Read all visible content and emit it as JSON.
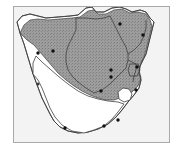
{
  "figure": {
    "kind": "distribution-map",
    "region": "Southern Africa",
    "frame": {
      "x": 13,
      "y": 6,
      "width": 157,
      "height": 137,
      "border_color": "#a9a9a9"
    },
    "colors": {
      "background": "#ffffff",
      "sea": "#f3f3f3",
      "land_unshaded": "#ffffff",
      "range_shading": "#9d9d9d",
      "stipple": "#7a7a7a",
      "coastline": "#404040",
      "country_border": "#404040",
      "point_marker": "#101010",
      "frame_border": "#a9a9a9"
    },
    "legend": {
      "shaded_area_label": "shaded distribution range",
      "point_label": "locality record"
    },
    "countries": [
      {
        "name": "Namibia",
        "shaded": true
      },
      {
        "name": "Botswana",
        "shaded": true
      },
      {
        "name": "Zimbabwe",
        "shaded": true
      },
      {
        "name": "Mozambique",
        "shaded": true
      },
      {
        "name": "South Africa",
        "shaded": "partial"
      },
      {
        "name": "Lesotho",
        "shaded": false
      },
      {
        "name": "Eswatini",
        "shaded": true
      }
    ],
    "points": [
      {
        "id": "p1",
        "x": 38,
        "y": 53
      },
      {
        "id": "p2",
        "x": 53,
        "y": 51
      },
      {
        "id": "p3",
        "x": 120,
        "y": 24
      },
      {
        "id": "p4",
        "x": 143,
        "y": 35
      },
      {
        "id": "p5",
        "x": 111,
        "y": 70
      },
      {
        "id": "p6",
        "x": 111,
        "y": 77
      },
      {
        "id": "p7",
        "x": 137,
        "y": 67
      },
      {
        "id": "p8",
        "x": 136,
        "y": 90
      },
      {
        "id": "p9",
        "x": 101,
        "y": 91
      },
      {
        "id": "p10",
        "x": 38,
        "y": 84
      },
      {
        "id": "p11",
        "x": 65,
        "y": 128
      },
      {
        "id": "p12",
        "x": 104,
        "y": 126
      },
      {
        "id": "p13",
        "x": 118,
        "y": 120
      }
    ],
    "point_count": 13
  }
}
